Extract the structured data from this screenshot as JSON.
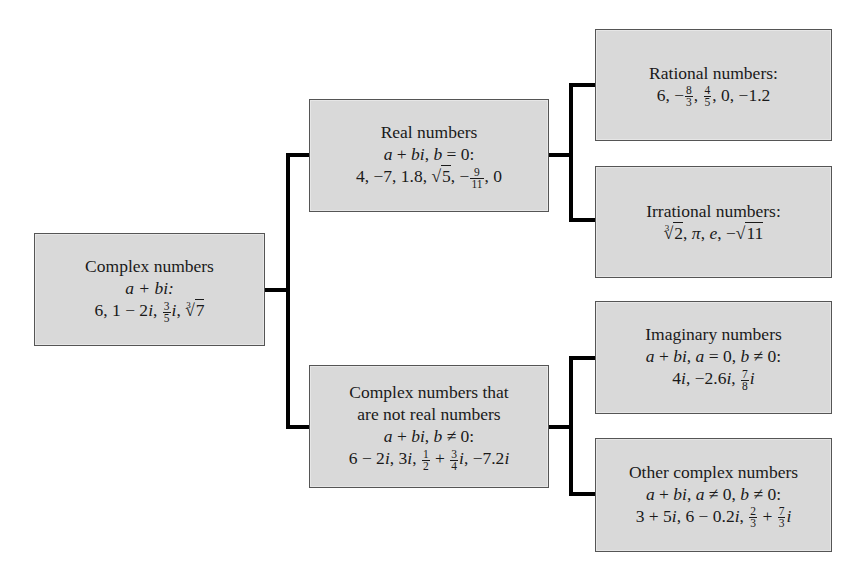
{
  "diagram": {
    "root": {
      "title": "Complex numbers",
      "condition": "a + bi:",
      "examples": [
        "6",
        "1 − 2i",
        "3/5 i",
        "∛7"
      ]
    },
    "real": {
      "title": "Real numbers",
      "condition": "a + bi, b = 0:",
      "examples": [
        "4",
        "−7",
        "1.8",
        "√5",
        "−9/11",
        "0"
      ]
    },
    "rational": {
      "title": "Rational numbers:",
      "examples": [
        "6",
        "−8/3",
        "4/5",
        "0",
        "−1.2"
      ]
    },
    "irrational": {
      "title": "Irrational numbers:",
      "examples": [
        "∛2",
        "π",
        "e",
        "−√11"
      ]
    },
    "nonreal": {
      "title_line1": "Complex numbers that",
      "title_line2": "are not real numbers",
      "condition": "a + bi, b ≠ 0:",
      "examples": [
        "6 − 2i",
        "3i",
        "1/2 + 3/4 i",
        "−7.2i"
      ]
    },
    "imaginary": {
      "title": "Imaginary numbers",
      "condition": "a + bi, a = 0, b ≠ 0:",
      "examples": [
        "4i",
        "−2.6i",
        "7/8 i"
      ]
    },
    "other": {
      "title": "Other complex numbers",
      "condition": "a + bi, a ≠ 0, b ≠ 0:",
      "examples": [
        "3 + 5i",
        "6 − 0.2i",
        "2/3 + 7/3 i"
      ]
    },
    "edges": [
      [
        "Complex numbers",
        "Real numbers"
      ],
      [
        "Complex numbers",
        "Complex numbers that are not real numbers"
      ],
      [
        "Real numbers",
        "Rational numbers"
      ],
      [
        "Real numbers",
        "Irrational numbers"
      ],
      [
        "Complex numbers that are not real numbers",
        "Imaginary numbers"
      ],
      [
        "Complex numbers that are not real numbers",
        "Other complex numbers"
      ]
    ],
    "colors": {
      "box_fill": "#d9d9d9",
      "box_border": "#555555",
      "connector": "#000000"
    }
  }
}
